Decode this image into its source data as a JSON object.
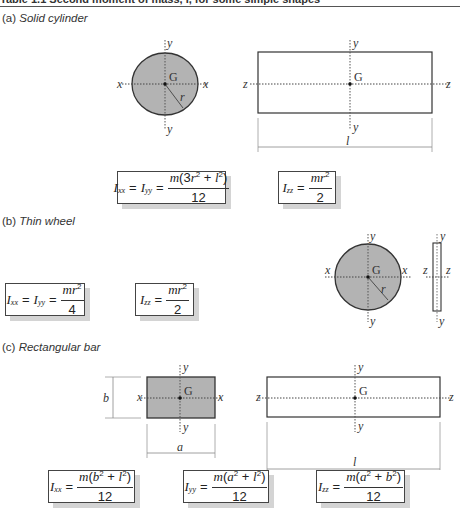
{
  "header": {
    "title": "Table 1.1   Second moment of mass, I, for some simple shapes"
  },
  "sections": [
    {
      "id": "a",
      "prefix": "(a)",
      "name": "Solid cylinder",
      "formulas": [
        {
          "lhs": "I_xx = I_yy",
          "numerator": "m(3r² + l²)",
          "denominator": "12"
        },
        {
          "lhs": "I_zz",
          "numerator": "mr²",
          "denominator": "2"
        }
      ]
    },
    {
      "id": "b",
      "prefix": "(b)",
      "name": "Thin wheel",
      "formulas": [
        {
          "lhs": "I_xx = I_yy",
          "numerator": "mr²",
          "denominator": "4"
        },
        {
          "lhs": "I_zz",
          "numerator": "mr²",
          "denominator": "2"
        }
      ]
    },
    {
      "id": "c",
      "prefix": "(c)",
      "name": "Rectangular bar",
      "formulas": [
        {
          "lhs": "I_xx",
          "numerator": "m(b² + l²)",
          "denominator": "12"
        },
        {
          "lhs": "I_yy",
          "numerator": "m(a² + l²)",
          "denominator": "12"
        },
        {
          "lhs": "I_zz",
          "numerator": "m(a² + b²)",
          "denominator": "12"
        }
      ]
    }
  ],
  "labels": {
    "x": "x",
    "y": "y",
    "z": "z",
    "G": "G",
    "r": "r",
    "l": "l",
    "a": "a",
    "b": "b",
    "sub_xx": "xx",
    "sub_yy": "yy",
    "sub_zz": "zz",
    "I": "I",
    "equals": "=",
    "m": "m",
    "r2": "r",
    "two": "2",
    "twelve": "12",
    "four": "4",
    "three": "3"
  },
  "colors": {
    "shape_fill": "#b3b3b3",
    "outline": "#333333",
    "axis": "#555555",
    "shadow": "#d4d4d4"
  }
}
